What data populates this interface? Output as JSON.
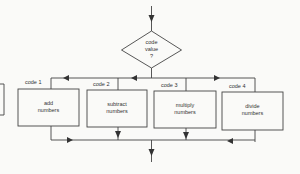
{
  "diagram": {
    "type": "flowchart",
    "decision": {
      "lines": [
        "code",
        "value",
        "?"
      ]
    },
    "branches": [
      {
        "code_label": "code  1",
        "lines": [
          "add",
          "numbers"
        ]
      },
      {
        "code_label": "code  2",
        "lines": [
          "subtract",
          "numbers"
        ]
      },
      {
        "code_label": "code  3",
        "lines": [
          "multiply",
          "numbers"
        ]
      },
      {
        "code_label": "code  4",
        "lines": [
          "divide",
          "numbers"
        ]
      }
    ],
    "colors": {
      "stroke": "#444444",
      "background": "#fafaf8"
    }
  }
}
